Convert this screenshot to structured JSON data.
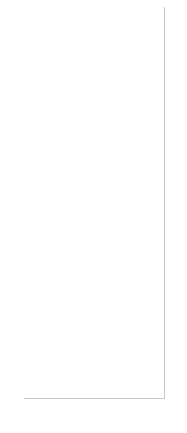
{
  "chart_data": {
    "type": "bar",
    "stacked": true,
    "orientation": "vertical",
    "title": "",
    "subtitle": "",
    "xlabel": "",
    "ylabel": "",
    "unit_label": "(십억원)",
    "ylim": [
      0,
      80
    ],
    "yticks": [
      0,
      20,
      40,
      60,
      80
    ],
    "ytick_labels": [
      "0",
      "20",
      "40",
      "60",
      "80"
    ],
    "grid": false,
    "legend_position": "top-left",
    "categories": [
      "1Q19",
      "2Q19",
      "3Q19",
      "4Q19",
      "1Q20",
      "2Q20",
      "3Q20",
      "4Q20",
      "1Q21E",
      "2Q21E",
      "3Q21E",
      "4Q21E",
      "1Q22E",
      "2Q22E",
      "3Q22E",
      "4Q22E"
    ],
    "xtick_labels": [
      "1Q19",
      "",
      "3Q19",
      "",
      "1Q20",
      "",
      "3Q20",
      "",
      "1Q21E",
      "",
      "3Q21E",
      "",
      "1Q22E",
      "",
      "3Q22E",
      ""
    ],
    "series": [
      {
        "name": "온라인",
        "color": "#7f7f7f",
        "values": [
          0.5,
          3.0,
          6.5,
          8.0,
          8.5,
          8.5,
          9.0,
          21.0,
          14.0,
          13.0,
          15.0,
          23.0,
          9.5,
          9.5,
          9.0,
          22.0
        ]
      },
      {
        "name": "대리점",
        "color": "#d9d9d9",
        "values": [
          0.0,
          0.0,
          0.0,
          0.0,
          0.0,
          0.0,
          5.0,
          12.0,
          11.0,
          20.0,
          24.0,
          33.0,
          41.5,
          49.5,
          51.0,
          58.0
        ]
      },
      {
        "name": "직영점",
        "color": "#ededed",
        "values": [
          0.0,
          0.0,
          0.0,
          0.0,
          0.0,
          0.0,
          0.0,
          0.0,
          0.0,
          0.0,
          0.0,
          0.0,
          0.0,
          0.0,
          0.0,
          0.0
        ]
      }
    ],
    "totals": [
      0.5,
      3.0,
      6.5,
      8.0,
      8.5,
      8.5,
      14.0,
      33.0,
      25.0,
      33.0,
      39.0,
      56.0,
      51.0,
      59.0,
      60.0,
      80.0
    ]
  },
  "legend": {
    "items": [
      {
        "label": "직영점",
        "color": "#ededed"
      },
      {
        "label": "대리점",
        "color": "#d9d9d9"
      },
      {
        "label": "온라인",
        "color": "#7f7f7f"
      }
    ]
  },
  "axis": {
    "unit": "(십억원)"
  }
}
